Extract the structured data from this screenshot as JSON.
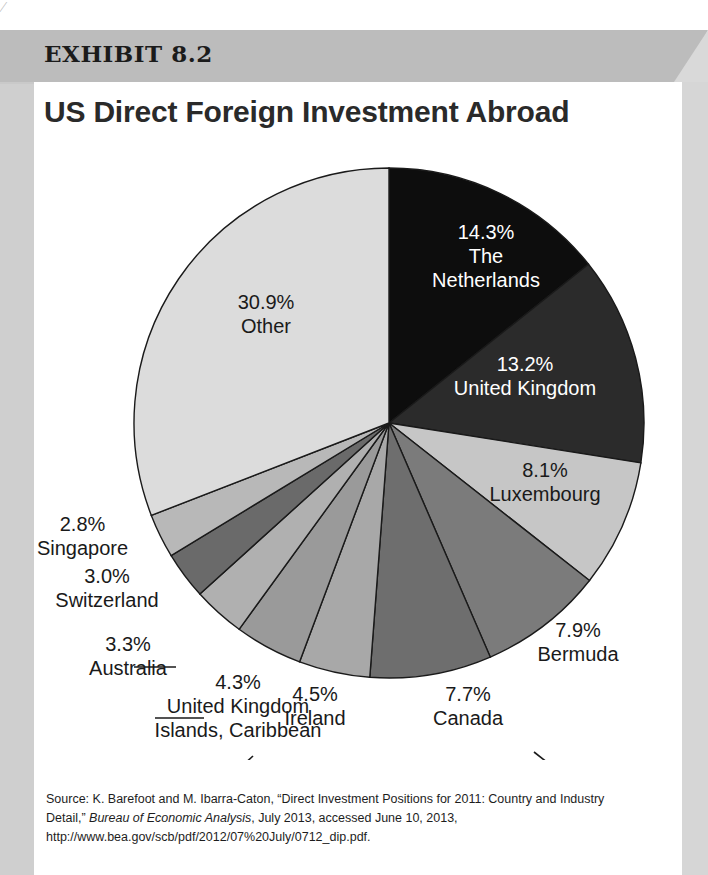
{
  "exhibit": {
    "label": "EXHIBIT 8.2",
    "title": "US Direct Foreign Investment Abroad"
  },
  "source": {
    "prefix": "Source: K. Barefoot and M. Ibarra-Caton, “Direct Investment Positions for 2011: Country and Industry Detail,” ",
    "italic": "Bureau of Economic Analysis",
    "suffix": ", July 2013, accessed June 10, 2013, http://www.bea.gov/scb/pdf/2012/07%20July/0712_dip.pdf."
  },
  "chart_data": {
    "type": "pie",
    "title": "US Direct Foreign Investment Abroad",
    "units": "percent",
    "start_angle_deg": 0,
    "direction": "clockwise",
    "total": 100.0,
    "categories": [
      "The Netherlands",
      "United Kingdom",
      "Luxembourg",
      "Bermuda",
      "Canada",
      "Ireland",
      "United Kingdom Islands, Caribbean",
      "Australia",
      "Switzerland",
      "Singapore",
      "Other"
    ],
    "values": [
      14.3,
      13.2,
      8.1,
      7.9,
      7.7,
      4.5,
      4.3,
      3.3,
      3.0,
      2.8,
      30.9
    ],
    "colors": [
      "#0d0d0d",
      "#2b2b2b",
      "#c6c6c6",
      "#7b7b7b",
      "#6e6e6e",
      "#a8a8a8",
      "#9a9a9a",
      "#b0b0b0",
      "#6a6a6a",
      "#b8b8b8",
      "#dcdcdc"
    ],
    "slices": [
      {
        "pct": "14.3%",
        "name": "The Netherlands",
        "value": 14.3,
        "label_lines": [
          "14.3%",
          "The",
          "Netherlands"
        ],
        "label_placement": "inside",
        "text_color": "#ffffff"
      },
      {
        "pct": "13.2%",
        "name": "United Kingdom",
        "value": 13.2,
        "label_lines": [
          "13.2%",
          "United Kingdom"
        ],
        "label_placement": "inside",
        "text_color": "#ffffff"
      },
      {
        "pct": "8.1%",
        "name": "Luxembourg",
        "value": 8.1,
        "label_lines": [
          "8.1%",
          "Luxembourg"
        ],
        "label_placement": "inside",
        "text_color": "#1a1a1a"
      },
      {
        "pct": "7.9%",
        "name": "Bermuda",
        "value": 7.9,
        "label_lines": [
          "7.9%",
          "Bermuda"
        ],
        "label_placement": "outside",
        "text_color": "#1a1a1a"
      },
      {
        "pct": "7.7%",
        "name": "Canada",
        "value": 7.7,
        "label_lines": [
          "7.7%",
          "Canada"
        ],
        "label_placement": "outside",
        "text_color": "#1a1a1a"
      },
      {
        "pct": "4.5%",
        "name": "Ireland",
        "value": 4.5,
        "label_lines": [
          "4.5%",
          "Ireland"
        ],
        "label_placement": "outside",
        "text_color": "#1a1a1a"
      },
      {
        "pct": "4.3%",
        "name": "United Kingdom Islands, Caribbean",
        "value": 4.3,
        "label_lines": [
          "4.3%",
          "United Kingdom",
          "Islands, Caribbean"
        ],
        "label_placement": "outside",
        "text_color": "#1a1a1a"
      },
      {
        "pct": "3.3%",
        "name": "Australia",
        "value": 3.3,
        "label_lines": [
          "3.3%",
          "Australia"
        ],
        "label_placement": "outside",
        "text_color": "#1a1a1a"
      },
      {
        "pct": "3.0%",
        "name": "Switzerland",
        "value": 3.0,
        "label_lines": [
          "3.0%",
          "Switzerland"
        ],
        "label_placement": "outside",
        "text_color": "#1a1a1a"
      },
      {
        "pct": "2.8%",
        "name": "Singapore",
        "value": 2.8,
        "label_lines": [
          "2.8%",
          "Singapore"
        ],
        "label_placement": "outside",
        "text_color": "#1a1a1a"
      },
      {
        "pct": "30.9%",
        "name": "Other",
        "value": 30.9,
        "label_lines": [
          "30.9%",
          "Other"
        ],
        "label_placement": "inside",
        "text_color": "#1a1a1a"
      }
    ]
  },
  "labels": {
    "netherlands_pct": "14.3%",
    "netherlands_l1": "The",
    "netherlands_l2": "Netherlands",
    "uk_pct": "13.2%",
    "uk_name": "United Kingdom",
    "lux_pct": "8.1%",
    "lux_name": "Luxembourg",
    "bermuda_pct": "7.9%",
    "bermuda_name": "Bermuda",
    "canada_pct": "7.7%",
    "canada_name": "Canada",
    "ireland_pct": "4.5%",
    "ireland_name": "Ireland",
    "ukislands_pct": "4.3%",
    "ukislands_l1": "United Kingdom",
    "ukislands_l2": "Islands, Caribbean",
    "australia_pct": "3.3%",
    "australia_name": "Australia",
    "switzerland_pct": "3.0%",
    "switzerland_name": "Switzerland",
    "singapore_pct": "2.8%",
    "singapore_name": "Singapore",
    "other_pct": "30.9%",
    "other_name": "Other"
  }
}
